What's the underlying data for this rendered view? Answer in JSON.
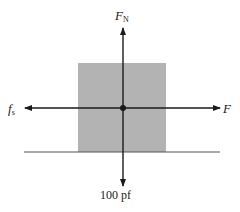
{
  "diagram": {
    "type": "free-body-diagram",
    "colors": {
      "block": "#b3b3b3",
      "lines": "#1a1a1a",
      "background": "#ffffff"
    },
    "labels": {
      "normal_force": {
        "main": "F",
        "subscript": "N"
      },
      "static_friction": {
        "main": "f",
        "subscript": "s"
      },
      "applied_force": {
        "main": "F"
      },
      "weight": "100 pf"
    }
  }
}
